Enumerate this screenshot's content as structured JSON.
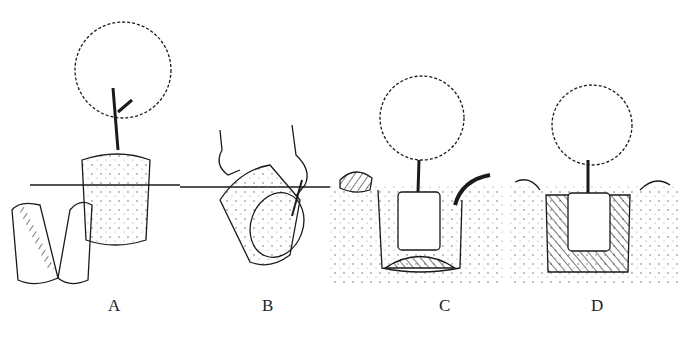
{
  "figure": {
    "panels": [
      {
        "id": "A",
        "label": "A",
        "description": "Tree with root ball removed from split container"
      },
      {
        "id": "B",
        "label": "B",
        "description": "Hands loosening roots of root ball laid on its side with knife"
      },
      {
        "id": "C",
        "label": "C",
        "description": "Tree placed in hole on mound of soil, hose watering"
      },
      {
        "id": "D",
        "label": "D",
        "description": "Hole backfilled with soil around root ball"
      }
    ],
    "colors": {
      "ink": "#1a1a1a",
      "background": "#ffffff"
    }
  }
}
